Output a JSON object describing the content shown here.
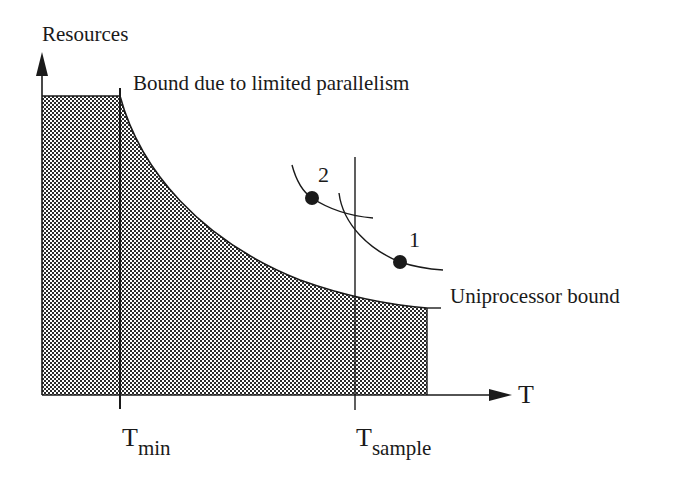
{
  "diagram": {
    "type": "resource-time tradeoff",
    "y_axis_label": "Resources",
    "x_axis_label": "T",
    "annotations": {
      "parallelism_bound": "Bound due to limited parallelism",
      "uniprocessor_bound": "Uniprocessor bound"
    },
    "x_ticks": [
      {
        "main": "T",
        "sub": "min"
      },
      {
        "main": "T",
        "sub": "sample"
      }
    ],
    "points": [
      {
        "label": "1"
      },
      {
        "label": "2"
      }
    ],
    "colors": {
      "ink": "#1a1a1a",
      "hatch_dark": "#2b2b2b",
      "hatch_light": "#ffffff",
      "background": "#ffffff"
    }
  }
}
